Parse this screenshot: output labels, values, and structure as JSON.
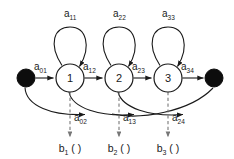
{
  "diagram": {
    "type": "state-machine",
    "colors": {
      "stroke": "#1a1a1a",
      "dashed_stroke": "#777777",
      "node_fill": "#ffffff",
      "terminal_fill": "#0d0d0d",
      "background": "#ffffff"
    },
    "nodes": [
      {
        "id": "start",
        "kind": "terminal",
        "label": "",
        "cx": 26,
        "cy": 78,
        "r": 9
      },
      {
        "id": "s1",
        "kind": "state",
        "label": "1",
        "cx": 70,
        "cy": 78,
        "r": 14
      },
      {
        "id": "s2",
        "kind": "state",
        "label": "2",
        "cx": 119,
        "cy": 78,
        "r": 14
      },
      {
        "id": "s3",
        "kind": "state",
        "label": "3",
        "cx": 168,
        "cy": 78,
        "r": 14
      },
      {
        "id": "end",
        "kind": "terminal",
        "label": "",
        "cx": 214,
        "cy": 78,
        "r": 9
      }
    ],
    "self_loops": [
      {
        "id": "loop1",
        "from": "s1",
        "to": "s1",
        "base": "a",
        "sub": "11",
        "label": "a11",
        "label_x": 64,
        "label_y": 17
      },
      {
        "id": "loop2",
        "from": "s2",
        "to": "s2",
        "base": "a",
        "sub": "22",
        "label": "a22",
        "label_x": 113,
        "label_y": 17
      },
      {
        "id": "loop3",
        "from": "s3",
        "to": "s3",
        "base": "a",
        "sub": "33",
        "label": "a33",
        "label_x": 162,
        "label_y": 17
      }
    ],
    "forward_edges": [
      {
        "id": "e01",
        "from": "start",
        "to": "s1",
        "base": "a",
        "sub": "01",
        "label": "a01",
        "label_x": 34,
        "label_y": 70
      },
      {
        "id": "e12",
        "from": "s1",
        "to": "s2",
        "base": "a",
        "sub": "12",
        "label": "a12",
        "label_x": 87,
        "label_y": 70
      },
      {
        "id": "e23",
        "from": "s2",
        "to": "s3",
        "base": "a",
        "sub": "23",
        "label": "a23",
        "label_x": 136,
        "label_y": 70
      },
      {
        "id": "e34",
        "from": "s3",
        "to": "end",
        "base": "a",
        "sub": "34",
        "label": "a34",
        "label_x": 185,
        "label_y": 70
      }
    ],
    "skip_edges": [
      {
        "id": "e02",
        "from": "start",
        "to": "s2",
        "base": "a",
        "sub": "02",
        "label": "a02",
        "label_x": 76,
        "label_y": 118
      },
      {
        "id": "e13",
        "from": "s1",
        "to": "s3",
        "base": "a",
        "sub": "13",
        "label": "a13",
        "label_x": 125,
        "label_y": 118
      },
      {
        "id": "e24",
        "from": "s2",
        "to": "end",
        "base": "a",
        "sub": "24",
        "label": "a24",
        "label_x": 174,
        "label_y": 118
      }
    ],
    "emissions": [
      {
        "id": "b1",
        "from": "s1",
        "base": "b",
        "sub": "1",
        "suffix": " ( )",
        "label": "b1 ( )",
        "x": 70,
        "y": 150
      },
      {
        "id": "b2",
        "from": "s2",
        "base": "b",
        "sub": "2",
        "suffix": " ( )",
        "label": "b2 ( )",
        "x": 119,
        "y": 150
      },
      {
        "id": "b3",
        "from": "s3",
        "base": "b",
        "sub": "3",
        "suffix": " ( )",
        "label": "b3 ( )",
        "x": 168,
        "y": 150
      }
    ]
  }
}
